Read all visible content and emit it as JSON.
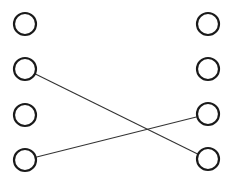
{
  "diagram": {
    "type": "bipartite-matching",
    "colors": {
      "background": "#ffffff",
      "node_stroke": "#1a1a1a",
      "edge_stroke": "#333333"
    },
    "node_radius": 11,
    "left_nodes": [
      {
        "id": "L1",
        "x": 25,
        "y": 24
      },
      {
        "id": "L2",
        "x": 25,
        "y": 69
      },
      {
        "id": "L3",
        "x": 25,
        "y": 115
      },
      {
        "id": "L4",
        "x": 25,
        "y": 160
      }
    ],
    "right_nodes": [
      {
        "id": "R1",
        "x": 208,
        "y": 24
      },
      {
        "id": "R2",
        "x": 208,
        "y": 69
      },
      {
        "id": "R3",
        "x": 208,
        "y": 114
      },
      {
        "id": "R4",
        "x": 208,
        "y": 159
      }
    ],
    "edges": [
      {
        "from": "L2",
        "to": "R4"
      },
      {
        "from": "L4",
        "to": "R3"
      }
    ]
  }
}
